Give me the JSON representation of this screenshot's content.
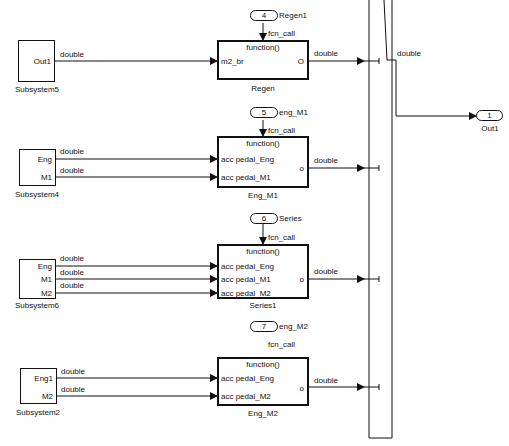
{
  "diagram": {
    "signal_type": "double",
    "fcn_call_label": "fcn_call",
    "function_label": "function()",
    "subsystems": [
      {
        "name": "Subsystem5",
        "outputs": [
          "Out1"
        ]
      },
      {
        "name": "Subsystem4",
        "outputs": [
          "Eng",
          "M1"
        ]
      },
      {
        "name": "Subsystem6",
        "outputs": [
          "Eng",
          "M1",
          "M2"
        ]
      },
      {
        "name": "Subsystem2",
        "outputs": [
          "Eng1",
          "M2"
        ]
      }
    ],
    "function_blocks": [
      {
        "name": "Regen",
        "inputs": [
          "m2_br"
        ],
        "output": "O",
        "trigger_port": "4",
        "trigger_name": "Regen1"
      },
      {
        "name": "Eng_M1",
        "inputs": [
          "acc pedal_Eng",
          "acc pedal_M1"
        ],
        "output": "o",
        "trigger_port": "5",
        "trigger_name": "eng_M1"
      },
      {
        "name": "Series1",
        "inputs": [
          "acc pedal_Eng",
          "acc pedal_M1",
          "acc pedal_M2"
        ],
        "output": "o",
        "trigger_port": "6",
        "trigger_name": "Series"
      },
      {
        "name": "Eng_M2",
        "inputs": [
          "acc pedal_Eng",
          "acc pedal_M2"
        ],
        "output": "o",
        "trigger_port": "7",
        "trigger_name": "eng_M2"
      }
    ],
    "merge_output_label": "double",
    "outport": {
      "number": "1",
      "name": "Out1"
    }
  }
}
